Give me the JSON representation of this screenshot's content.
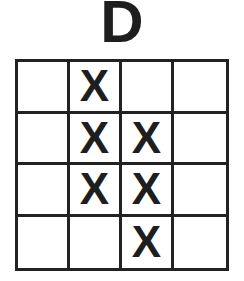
{
  "title": "D",
  "grid": {
    "rows": 4,
    "cols": 4,
    "cells": [
      [
        "",
        "X",
        "",
        ""
      ],
      [
        "",
        "X",
        "X",
        ""
      ],
      [
        "",
        "X",
        "X",
        ""
      ],
      [
        "",
        "",
        "X",
        ""
      ]
    ]
  }
}
